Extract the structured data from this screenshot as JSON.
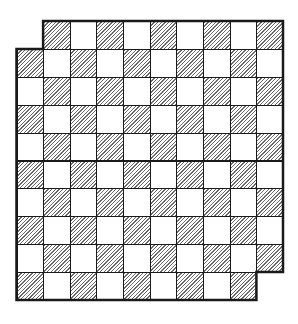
{
  "diagram": {
    "title": "",
    "type": "mutilated-checkerboard",
    "rows": 10,
    "cols": 10,
    "origin": {
      "x": 16.5,
      "y": 21
    },
    "cell_width": 26.65,
    "cell_height": 27.9,
    "removed_cells": [
      {
        "row": 0,
        "col": 0
      },
      {
        "row": 9,
        "col": 9
      }
    ],
    "dark_rule": "(row + col) is odd",
    "colors": {
      "grid_line": "#1a1a1a",
      "hatch": "#6b6b6b",
      "light": "#ffffff",
      "background": "#ffffff"
    },
    "hatch_direction": "diagonal /",
    "total_squares_shown": 98,
    "dark_squares": 50,
    "light_squares": 48
  }
}
